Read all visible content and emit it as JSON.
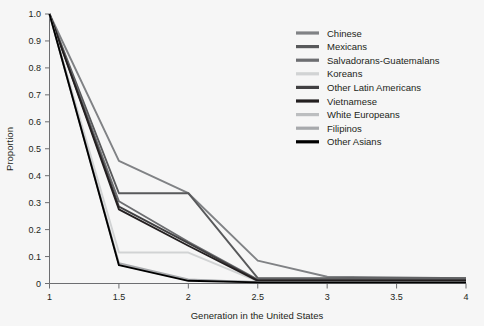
{
  "chart_data": {
    "type": "line",
    "title": "",
    "xlabel": "Generation in the United States",
    "ylabel": "Proportion",
    "xlim": [
      1,
      4
    ],
    "ylim": [
      0,
      1.0
    ],
    "xticks": [
      "1",
      "1.5",
      "2",
      "2.5",
      "3",
      "3.5",
      "4"
    ],
    "xtick_values": [
      1,
      1.5,
      2,
      2.5,
      3,
      3.5,
      4
    ],
    "yticks": [
      "0",
      "0.1",
      "0.2",
      "0.3",
      "0.4",
      "0.5",
      "0.6",
      "0.7",
      "0.8",
      "0.9",
      "1.0"
    ],
    "ytick_values": [
      0,
      0.1,
      0.2,
      0.3,
      0.4,
      0.5,
      0.6,
      0.7,
      0.8,
      0.9,
      1.0
    ],
    "grid": false,
    "legend_position": "top-right",
    "background_color": "#f6f6f6",
    "series": [
      {
        "name": "Chinese",
        "color": "#808285",
        "x": [
          1,
          1.5,
          2,
          2.5,
          3,
          3.5,
          4
        ],
        "values": [
          1.0,
          0.455,
          0.335,
          0.085,
          0.025,
          0.022,
          0.02
        ]
      },
      {
        "name": "Mexicans",
        "color": "#58595b",
        "x": [
          1,
          1.5,
          2,
          2.5,
          3,
          3.5,
          4
        ],
        "values": [
          1.0,
          0.335,
          0.335,
          0.02,
          0.02,
          0.02,
          0.02
        ]
      },
      {
        "name": "Salvadorans-Guatemalans",
        "color": "#6d6e71",
        "x": [
          1,
          1.5,
          2,
          2.5,
          3,
          3.5,
          4
        ],
        "values": [
          1.0,
          0.305,
          0.155,
          0.015,
          0.015,
          0.015,
          0.015
        ]
      },
      {
        "name": "Koreans",
        "color": "#d1d3d4",
        "x": [
          1,
          1.5,
          2,
          2.5,
          3,
          3.5,
          4
        ],
        "values": [
          1.0,
          0.115,
          0.115,
          0.008,
          0.008,
          0.008,
          0.008
        ]
      },
      {
        "name": "Other Latin Americans",
        "color": "#414042",
        "x": [
          1,
          1.5,
          2,
          2.5,
          3,
          3.5,
          4
        ],
        "values": [
          1.0,
          0.285,
          0.15,
          0.012,
          0.012,
          0.012,
          0.012
        ]
      },
      {
        "name": "Vietnamese",
        "color": "#231f20",
        "x": [
          1,
          1.5,
          2,
          2.5,
          3,
          3.5,
          4
        ],
        "values": [
          1.0,
          0.275,
          0.14,
          0.01,
          0.01,
          0.01,
          0.01
        ]
      },
      {
        "name": "White Europeans",
        "color": "#bcbec0",
        "x": [
          1,
          1.5,
          2,
          2.5,
          3,
          3.5,
          4
        ],
        "values": [
          1.0,
          0.07,
          0.012,
          0.006,
          0.006,
          0.006,
          0.006
        ]
      },
      {
        "name": "Filipinos",
        "color": "#a7a9ac",
        "x": [
          1,
          1.5,
          2,
          2.5,
          3,
          3.5,
          4
        ],
        "values": [
          1.0,
          0.075,
          0.015,
          0.005,
          0.005,
          0.005,
          0.005
        ]
      },
      {
        "name": "Other Asians",
        "color": "#000000",
        "x": [
          1,
          1.5,
          2,
          2.5,
          3,
          3.5,
          4
        ],
        "values": [
          1.0,
          0.068,
          0.01,
          0.004,
          0.004,
          0.004,
          0.004
        ]
      }
    ]
  }
}
